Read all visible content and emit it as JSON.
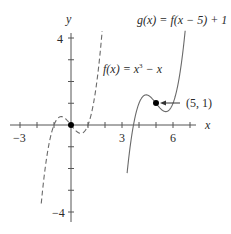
{
  "chart_data": {
    "type": "line",
    "title": "",
    "xlabel": "x",
    "ylabel": "y",
    "xlim": [
      -3.5,
      7.3
    ],
    "ylim": [
      -4.4,
      4.9
    ],
    "x_ticks": [
      -3,
      -2,
      -1,
      0,
      1,
      2,
      3,
      4,
      5,
      6,
      7
    ],
    "x_tick_labels": [
      {
        "value": -3,
        "label": "−3"
      },
      {
        "value": 3,
        "label": "3"
      },
      {
        "value": 6,
        "label": "6"
      }
    ],
    "y_ticks": [
      -4,
      -3,
      -2,
      -1,
      1,
      2,
      3,
      4
    ],
    "y_tick_labels": [
      {
        "value": 4,
        "label": "4"
      },
      {
        "value": -4,
        "label": "−4"
      }
    ],
    "grid": false,
    "series": [
      {
        "name": "f(x) = x³ − x",
        "style": "dashed",
        "formula": "x^3 - x",
        "x_range": [
          -1.75,
          1.85
        ]
      },
      {
        "name": "g(x) = f(x − 5) + 1",
        "style": "solid",
        "formula": "(x-5)^3 - (x-5) + 1",
        "x_range": [
          3.3,
          6.75
        ]
      }
    ],
    "points": [
      {
        "x": 0,
        "y": 0,
        "label": ""
      },
      {
        "x": 5,
        "y": 1,
        "label": "(5, 1)"
      }
    ],
    "annotations": [
      {
        "text": "f(x) = x³ − x",
        "near": "dashed curve"
      },
      {
        "text": "g(x) = f(x − 5) + 1",
        "near": "solid curve"
      },
      {
        "text": "(5, 1)",
        "arrow_to": [
          5,
          1
        ]
      }
    ]
  },
  "labels": {
    "x_axis": "x",
    "y_axis": "y",
    "tick_neg3": "−3",
    "tick_3": "3",
    "tick_6": "6",
    "tick_4": "4",
    "tick_neg4": "−4",
    "f_label_prefix": "f(x) = x",
    "f_label_exp": "3",
    "f_label_suffix": " − x",
    "g_label": "g(x) = f(x − 5) + 1",
    "point_label": "(5, 1)"
  },
  "colors": {
    "axis": "#555555",
    "curve": "#6a6a6a",
    "point": "#000000",
    "text": "#2a2a2a"
  }
}
